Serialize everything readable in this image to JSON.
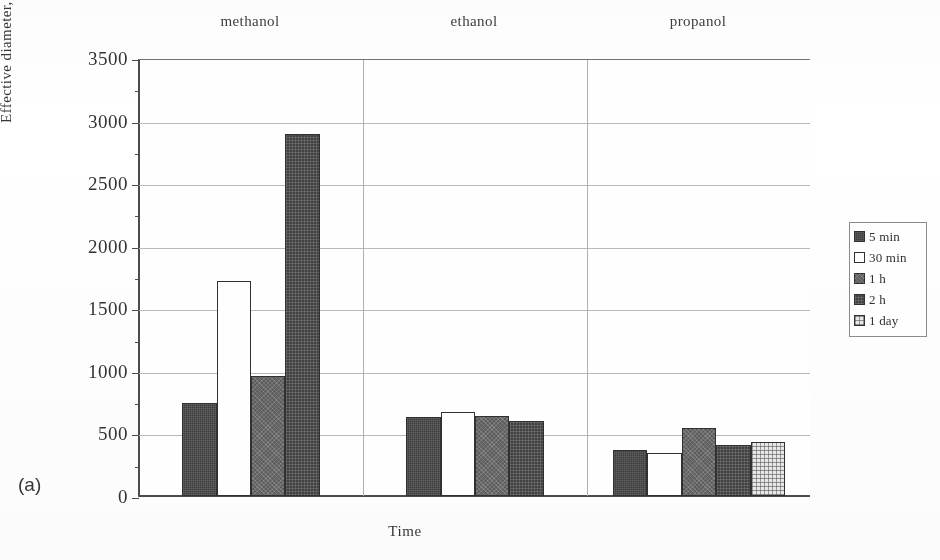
{
  "panel": {
    "label": "(a)"
  },
  "axes": {
    "ylabel": "Effective diameter, nm",
    "xlabel": "Time",
    "yticks": [
      "3500",
      "3000",
      "2500",
      "2000",
      "1500",
      "1000",
      "500",
      "0"
    ]
  },
  "legend": {
    "items": [
      {
        "label": "5 min",
        "swatch": "dark-hatch-swatch",
        "fill": "fill-dark"
      },
      {
        "label": "30 min",
        "swatch": "white-swatch",
        "fill": "fill-white"
      },
      {
        "label": "1 h",
        "swatch": "mid-gray-swatch",
        "fill": "fill-mid"
      },
      {
        "label": "2 h",
        "swatch": "dark-dotted-swatch",
        "fill": "fill-dark2"
      },
      {
        "label": "1 day",
        "swatch": "light-dotted-swatch",
        "fill": "fill-light-dot"
      }
    ]
  },
  "groups": [
    {
      "name": "methanol"
    },
    {
      "name": "ethanol"
    },
    {
      "name": "propanol"
    }
  ],
  "chart_data": {
    "type": "bar",
    "title": "",
    "xlabel": "Time",
    "ylabel": "Effective diameter, nm",
    "ylim": [
      0,
      3500
    ],
    "ytick_step": 500,
    "grid": true,
    "legend_position": "right",
    "categories": [
      "methanol",
      "ethanol",
      "propanol"
    ],
    "series": [
      {
        "name": "5 min",
        "values": [
          740,
          630,
          370
        ]
      },
      {
        "name": "30 min",
        "values": [
          1720,
          675,
          345
        ]
      },
      {
        "name": "1 h",
        "values": [
          960,
          640,
          540
        ]
      },
      {
        "name": "2 h",
        "values": [
          2890,
          600,
          405
        ]
      },
      {
        "name": "1 day",
        "values": [
          null,
          null,
          435
        ]
      }
    ]
  }
}
